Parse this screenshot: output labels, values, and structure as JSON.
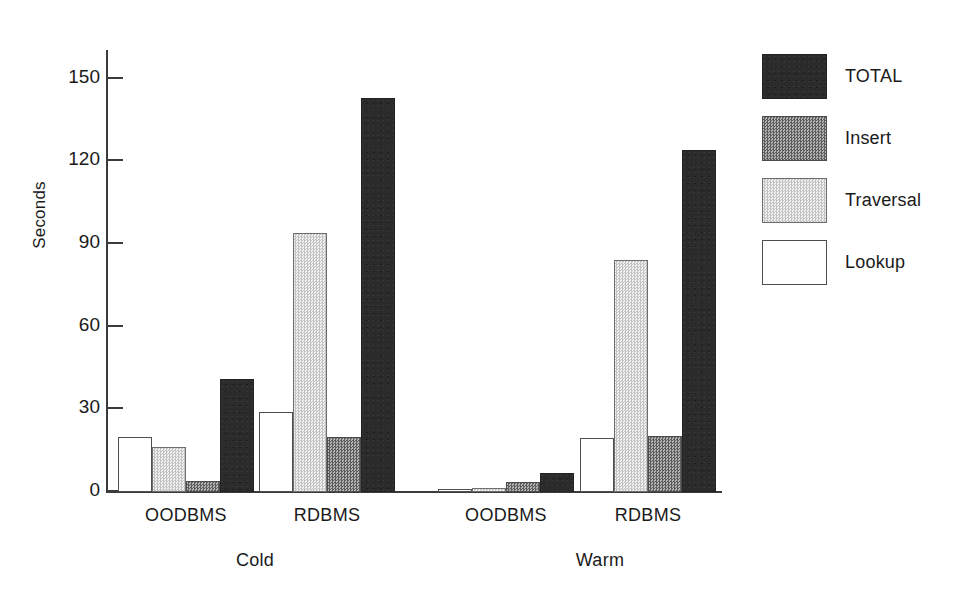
{
  "chart_data": {
    "type": "bar",
    "title": "",
    "subtitle": "",
    "xlabel": "",
    "ylabel": "Seconds",
    "ylim": [
      0,
      160
    ],
    "ytick_values": [
      0,
      30,
      60,
      90,
      120,
      150
    ],
    "ytick_labels": [
      "0",
      "30",
      "60",
      "90",
      "120",
      "150"
    ],
    "grid": false,
    "legend_position": "right",
    "categories": [
      "OODBMS",
      "RDBMS",
      "OODBMS",
      "RDBMS"
    ],
    "group_labels": [
      "Cold",
      "Warm"
    ],
    "groups": [
      {
        "group": "Cold",
        "system": "OODBMS",
        "bars": [
          {
            "series": "Lookup",
            "value": 20
          },
          {
            "series": "Traversal",
            "value": 16.5
          },
          {
            "series": "Insert",
            "value": 4
          },
          {
            "series": "TOTAL",
            "value": 41
          }
        ]
      },
      {
        "group": "Cold",
        "system": "RDBMS",
        "bars": [
          {
            "series": "Lookup",
            "value": 29
          },
          {
            "series": "Traversal",
            "value": 94
          },
          {
            "series": "Insert",
            "value": 20
          },
          {
            "series": "TOTAL",
            "value": 143
          }
        ]
      },
      {
        "group": "Warm",
        "system": "OODBMS",
        "bars": [
          {
            "series": "Lookup",
            "value": 1.2
          },
          {
            "series": "Traversal",
            "value": 1.5
          },
          {
            "series": "Insert",
            "value": 3.5
          },
          {
            "series": "TOTAL",
            "value": 7
          }
        ]
      },
      {
        "group": "Warm",
        "system": "RDBMS",
        "bars": [
          {
            "series": "Lookup",
            "value": 19.5
          },
          {
            "series": "Traversal",
            "value": 84
          },
          {
            "series": "Insert",
            "value": 20.5
          },
          {
            "series": "TOTAL",
            "value": 124
          }
        ]
      }
    ],
    "series": [
      {
        "name": "TOTAL",
        "values": [
          41,
          143,
          7,
          124
        ],
        "swatch": "black-solid",
        "color": "#2b2b2b"
      },
      {
        "name": "Insert",
        "values": [
          4,
          20,
          3.5,
          20.5
        ],
        "swatch": "dark-gray-checker",
        "color": "#828282"
      },
      {
        "name": "Traversal",
        "values": [
          16.5,
          94,
          1.5,
          84
        ],
        "swatch": "light-gray-checker",
        "color": "#dcdcdc"
      },
      {
        "name": "Lookup",
        "values": [
          20,
          29,
          1.2,
          19.5
        ],
        "swatch": "white-outline",
        "color": "#ffffff"
      }
    ]
  },
  "legend": {
    "entries": [
      {
        "label": "TOTAL"
      },
      {
        "label": "Insert"
      },
      {
        "label": "Traversal"
      },
      {
        "label": "Lookup"
      }
    ]
  },
  "axis": {
    "y_title": "Seconds"
  }
}
